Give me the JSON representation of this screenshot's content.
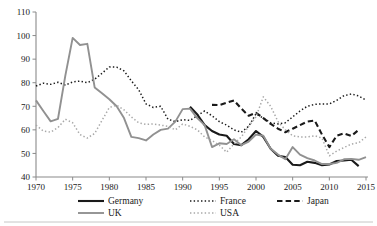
{
  "chart_data": {
    "type": "line",
    "title": "",
    "xlabel": "",
    "ylabel": "",
    "xlim": [
      1970,
      2015
    ],
    "ylim": [
      40,
      110
    ],
    "yticks": [
      40,
      50,
      60,
      70,
      80,
      90,
      100,
      110
    ],
    "xticks": [
      1970,
      1975,
      1980,
      1985,
      1990,
      1995,
      2000,
      2005,
      2010,
      2015
    ],
    "grid": false,
    "legend_position": "bottom",
    "series": [
      {
        "name": "Germany",
        "color": "#1a1a1a",
        "style": "solid",
        "width": 2.1,
        "x": [
          1991,
          1992,
          1993,
          1994,
          1995,
          1996,
          1997,
          1998,
          1999,
          2000,
          2001,
          2002,
          2003,
          2004,
          2005,
          2006,
          2007,
          2008,
          2009,
          2010,
          2011,
          2012,
          2013,
          2014
        ],
        "values": [
          69.8,
          66.5,
          62.0,
          59.5,
          58.0,
          57.5,
          54.0,
          53.5,
          56.0,
          59.5,
          57.0,
          52.0,
          49.0,
          48.5,
          45.2,
          45.0,
          46.5,
          46.0,
          45.0,
          45.3,
          46.8,
          47.0,
          47.3,
          44.6
        ]
      },
      {
        "name": "France",
        "color": "#1a1a1a",
        "style": "dotted",
        "width": 1.5,
        "x": [
          1970,
          1971,
          1972,
          1973,
          1974,
          1975,
          1976,
          1977,
          1978,
          1979,
          1980,
          1981,
          1982,
          1983,
          1984,
          1985,
          1986,
          1987,
          1988,
          1989,
          1990,
          1991,
          1992,
          1993,
          1994,
          1995,
          1996,
          1997,
          1998,
          1999,
          2000,
          2001,
          2002,
          2003,
          2004,
          2005,
          2006,
          2007,
          2008,
          2009,
          2010,
          2011,
          2012,
          2013,
          2014,
          2015
        ],
        "values": [
          78.6,
          79.8,
          79.3,
          80.2,
          79.0,
          80.3,
          80.7,
          80.0,
          81.5,
          84.0,
          86.7,
          86.6,
          85.0,
          80.8,
          77.0,
          71.0,
          69.5,
          70.0,
          64.5,
          63.5,
          64.3,
          64.0,
          66.0,
          68.0,
          66.0,
          63.5,
          62.0,
          60.0,
          59.0,
          61.5,
          66.8,
          65.0,
          63.0,
          62.5,
          63.0,
          65.5,
          68.0,
          70.0,
          70.8,
          71.0,
          71.0,
          72.5,
          74.5,
          75.2,
          74.4,
          72.6
        ]
      },
      {
        "name": "Japan",
        "color": "#1a1a1a",
        "style": "dashed",
        "width": 2.1,
        "x": [
          1994,
          1995,
          1996,
          1997,
          1998,
          1999,
          2000,
          2001,
          2002,
          2003,
          2004,
          2005,
          2006,
          2007,
          2008,
          2009,
          2010,
          2011,
          2012,
          2013,
          2014
        ],
        "values": [
          70.6,
          70.5,
          71.5,
          72.5,
          69.0,
          66.0,
          67.2,
          65.0,
          62.5,
          60.5,
          59.0,
          60.5,
          62.0,
          63.5,
          64.0,
          58.0,
          52.7,
          57.5,
          58.5,
          57.4,
          60.0
        ]
      },
      {
        "name": "UK",
        "color": "#919191",
        "style": "solid",
        "width": 1.9,
        "x": [
          1970,
          1971,
          1972,
          1973,
          1974,
          1975,
          1976,
          1977,
          1978,
          1979,
          1980,
          1981,
          1982,
          1983,
          1984,
          1985,
          1986,
          1987,
          1988,
          1989,
          1990,
          1991,
          1992,
          1993,
          1994,
          1995,
          1996,
          1997,
          1998,
          1999,
          2000,
          2001,
          2002,
          2003,
          2004,
          2005,
          2006,
          2007,
          2008,
          2009,
          2010,
          2011,
          2012,
          2013,
          2014,
          2015
        ],
        "values": [
          72.5,
          68.0,
          63.6,
          64.7,
          83.0,
          99.0,
          96.0,
          96.5,
          78.0,
          75.5,
          73.0,
          70.0,
          65.0,
          57.0,
          56.5,
          55.5,
          58.0,
          60.0,
          60.5,
          63.5,
          68.8,
          69.0,
          65.0,
          62.0,
          52.7,
          54.3,
          54.0,
          56.0,
          53.5,
          55.0,
          58.0,
          57.5,
          52.0,
          49.5,
          47.5,
          52.7,
          49.5,
          48.0,
          47.0,
          45.5,
          45.5,
          46.0,
          47.5,
          47.7,
          47.3,
          48.4
        ]
      },
      {
        "name": "USA",
        "color": "#a8a8a8",
        "style": "dotted",
        "width": 1.5,
        "x": [
          1970,
          1971,
          1972,
          1973,
          1974,
          1975,
          1976,
          1977,
          1978,
          1979,
          1980,
          1981,
          1982,
          1983,
          1984,
          1985,
          1986,
          1987,
          1988,
          1989,
          1990,
          1991,
          1992,
          1993,
          1994,
          1995,
          1996,
          1997,
          1998,
          1999,
          2000,
          2001,
          2002,
          2003,
          2004,
          2005,
          2006,
          2007,
          2008,
          2009,
          2010,
          2011,
          2012,
          2013,
          2014,
          2015
        ],
        "values": [
          62.0,
          59.5,
          59.0,
          61.0,
          64.5,
          63.0,
          58.0,
          56.5,
          58.5,
          64.0,
          69.5,
          70.5,
          68.5,
          65.5,
          63.0,
          62.3,
          62.5,
          62.0,
          61.5,
          60.0,
          62.5,
          61.5,
          60.0,
          57.0,
          55.5,
          53.5,
          50.5,
          54.0,
          57.0,
          61.5,
          65.5,
          74.0,
          70.0,
          63.5,
          60.0,
          57.5,
          57.0,
          57.0,
          57.5,
          56.5,
          49.0,
          51.0,
          52.5,
          54.0,
          54.5,
          57.0
        ]
      }
    ],
    "legend": [
      {
        "label": "Germany",
        "color": "#1a1a1a",
        "style": "solid",
        "width": 2.1
      },
      {
        "label": "France",
        "color": "#1a1a1a",
        "style": "dotted",
        "width": 1.5
      },
      {
        "label": "Japan",
        "color": "#1a1a1a",
        "style": "dashed",
        "width": 2.1
      },
      {
        "label": "UK",
        "color": "#919191",
        "style": "solid",
        "width": 1.9
      },
      {
        "label": "USA",
        "color": "#a8a8a8",
        "style": "dotted",
        "width": 1.5
      }
    ]
  }
}
